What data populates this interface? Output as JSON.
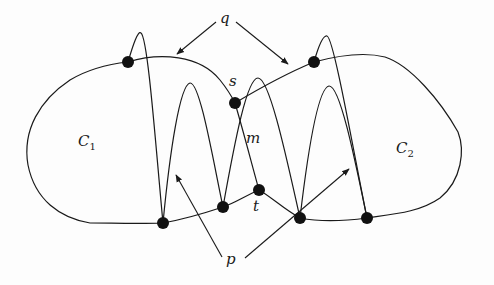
{
  "diagram": {
    "labels": {
      "q": "q",
      "p": "p",
      "s": "s",
      "m": "m",
      "t": "t",
      "c1_main": "C",
      "c1_sub": "1",
      "c2_main": "C",
      "c2_sub": "2"
    },
    "nodes": [
      {
        "id": "q1-point",
        "x": 128,
        "y": 62
      },
      {
        "id": "s",
        "x": 235,
        "y": 103
      },
      {
        "id": "q2-point",
        "x": 314,
        "y": 62
      },
      {
        "id": "bottom-1",
        "x": 163,
        "y": 223
      },
      {
        "id": "bottom-2",
        "x": 223,
        "y": 207
      },
      {
        "id": "t",
        "x": 259,
        "y": 190
      },
      {
        "id": "bottom-3",
        "x": 300,
        "y": 218
      },
      {
        "id": "bottom-4",
        "x": 367,
        "y": 218
      }
    ],
    "colors": {
      "stroke": "#1a1a1a",
      "dot": "#111111",
      "background": "#fdfdfd"
    }
  }
}
